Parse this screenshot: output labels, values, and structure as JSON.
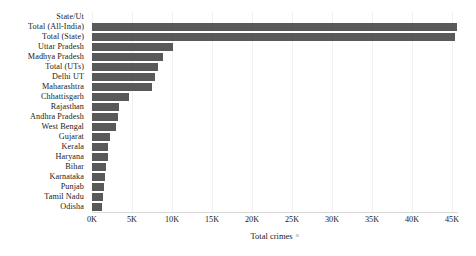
{
  "chart_data": {
    "type": "bar",
    "orientation": "horizontal",
    "title": "",
    "xlabel": "Total crimes",
    "ylabel": "State/Ut",
    "xlim": [
      0,
      45750
    ],
    "grid": true,
    "legend": null,
    "bar_color": "#595959",
    "xtick_labels": [
      "0K",
      "5K",
      "10K",
      "15K",
      "20K",
      "25K",
      "30K",
      "35K",
      "40K",
      "45K"
    ],
    "xtick_values": [
      0,
      5000,
      10000,
      15000,
      20000,
      25000,
      30000,
      35000,
      40000,
      45000
    ],
    "categories": [
      "Total (All-India)",
      "Total (State)",
      "Uttar Pradesh",
      "Madhya Pradesh",
      "Total (UTs)",
      "Delhi UT",
      "Maharashtra",
      "Chhattisgarh",
      "Rajasthan",
      "Andhra Pradesh",
      "West Bengal",
      "Gujarat",
      "Kerala",
      "Haryana",
      "Bihar",
      "Karnataka",
      "Punjab",
      "Tamil Nadu",
      "Odisha"
    ],
    "values": [
      45600,
      45400,
      10100,
      8900,
      8250,
      7900,
      7500,
      4600,
      3400,
      3200,
      3050,
      2200,
      2000,
      1950,
      1800,
      1650,
      1500,
      1350,
      1250
    ]
  },
  "axis": {
    "y_axis_title": "State/Ut",
    "x_axis_title": "Total crimes",
    "sort_glyph": "≡"
  }
}
